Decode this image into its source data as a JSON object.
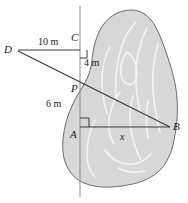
{
  "figure": {
    "background_color": "#ffffff",
    "width": 188,
    "height": 203,
    "blob": {
      "name": "lake-region",
      "fill_color": "#d7d7d7",
      "stroke_color": "#6b6b6b",
      "contour_color": "#f2f2f2"
    },
    "lines": {
      "stroke_color": "#3a3a3a",
      "vertical_line_color": "#8a8a8a"
    },
    "points": [
      {
        "id": "D",
        "label": "D",
        "x": 13,
        "y": 50
      },
      {
        "id": "C",
        "label": "C",
        "x": 80,
        "y": 45
      },
      {
        "id": "P",
        "label": "P",
        "x": 80,
        "y": 89
      },
      {
        "id": "A",
        "label": "A",
        "x": 80,
        "y": 127
      },
      {
        "id": "B",
        "label": "B",
        "x": 170,
        "y": 127
      }
    ],
    "measurements": [
      {
        "id": "DC",
        "label": "10 m",
        "from": "D",
        "to": "C"
      },
      {
        "id": "CP",
        "label": "4 m",
        "from": "C",
        "to": "P"
      },
      {
        "id": "PA",
        "label": "6 m",
        "from": "P",
        "to": "A"
      },
      {
        "id": "AB",
        "label": "x",
        "from": "A",
        "to": "B"
      }
    ],
    "right_angles": [
      {
        "id": "angle-at-C",
        "at": "C"
      },
      {
        "id": "angle-at-A",
        "at": "A"
      }
    ]
  }
}
